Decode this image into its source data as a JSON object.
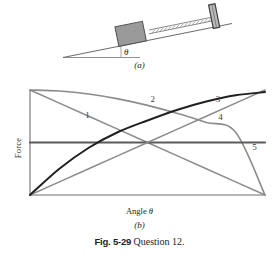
{
  "figure": {
    "number_label": "Fig. 5-29",
    "description": "Question 12.",
    "panel_a_label": "(a)",
    "panel_b_label": "(b)"
  },
  "panel_a": {
    "name": "block-spring-on-incline",
    "angle_symbol": "θ",
    "elements": {
      "block_fill": "#9a9a9a",
      "incline_line": "#6f6f6f",
      "ground_line": "#8a8a8a",
      "spring": "#8a8a8a",
      "post": "#4a4a4a"
    }
  },
  "chart_data": {
    "type": "line",
    "title": "",
    "xlabel_prefix": "Angle",
    "xlabel_symbol": "θ",
    "ylabel": "Force",
    "grid": false,
    "axis_ticks": false,
    "legend": "inline-curve-numbers",
    "xlim": [
      0,
      90
    ],
    "ylim": [
      -1,
      1
    ],
    "series": [
      {
        "name": "1",
        "label": "1",
        "shape": "linear-decreasing",
        "color": "#8c8c8c",
        "width": 1.6,
        "x": [
          0,
          11.25,
          22.5,
          33.75,
          45,
          56.25,
          67.5,
          78.75,
          90
        ],
        "y": [
          1.0,
          0.75,
          0.5,
          0.25,
          0.0,
          -0.25,
          -0.5,
          -0.75,
          -1.0
        ],
        "label_x": 22,
        "label_y": 0.46
      },
      {
        "name": "2",
        "label": "2",
        "shape": "cosine-decreasing",
        "color": "#8c8c8c",
        "width": 1.6,
        "x": [
          0,
          11.25,
          22.5,
          33.75,
          45,
          56.25,
          67.5,
          78.75,
          90
        ],
        "y": [
          1.0,
          0.981,
          0.924,
          0.831,
          0.707,
          0.556,
          0.383,
          0.195,
          -1.0
        ],
        "label_x": 47,
        "label_y": 0.78
      },
      {
        "name": "3",
        "label": "3",
        "shape": "sine-increasing",
        "color": "#231f20",
        "width": 2.0,
        "x": [
          0,
          11.25,
          22.5,
          33.75,
          45,
          56.25,
          67.5,
          78.75,
          90
        ],
        "y": [
          -1.0,
          -0.5,
          -0.1,
          0.2,
          0.42,
          0.62,
          0.78,
          0.9,
          0.96
        ],
        "label_x": 72,
        "label_y": 0.78
      },
      {
        "name": "4",
        "label": "4",
        "shape": "linear-increasing",
        "color": "#8c8c8c",
        "width": 1.6,
        "x": [
          0,
          11.25,
          22.5,
          33.75,
          45,
          56.25,
          67.5,
          78.75,
          90
        ],
        "y": [
          -1.0,
          -0.75,
          -0.5,
          -0.25,
          0.0,
          0.25,
          0.5,
          0.75,
          1.0
        ],
        "label_x": 73,
        "label_y": 0.42
      },
      {
        "name": "5",
        "label": "5",
        "shape": "constant",
        "color": "#5a5a5a",
        "width": 2.2,
        "x": [
          0,
          90
        ],
        "y": [
          0.0,
          0.0
        ],
        "label_x": 86,
        "label_y": -0.14
      }
    ]
  }
}
